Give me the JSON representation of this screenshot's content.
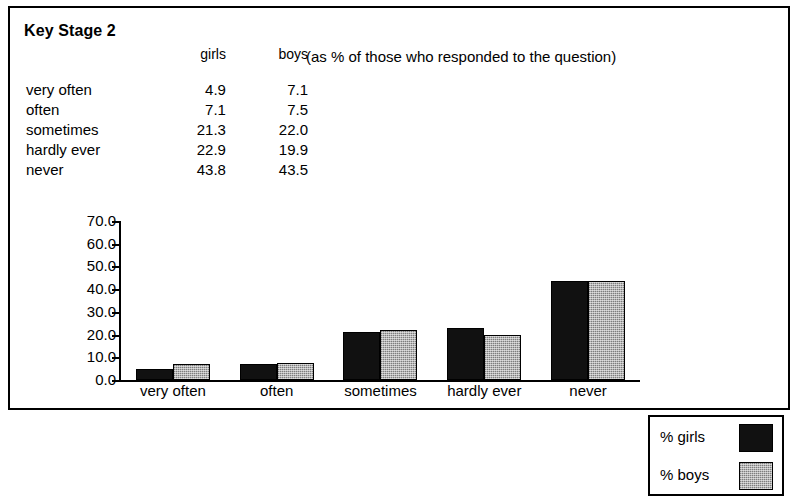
{
  "figure": {
    "title": "Key Stage 2",
    "note": "(as % of those who responded to the question)"
  },
  "table": {
    "columns": [
      "",
      "girls",
      "boys"
    ],
    "rows": [
      {
        "label": "very often",
        "girls": "4.9",
        "boys": "7.1"
      },
      {
        "label": "often",
        "girls": "7.1",
        "boys": "7.5"
      },
      {
        "label": "sometimes",
        "girls": "21.3",
        "boys": "22.0"
      },
      {
        "label": "hardly ever",
        "girls": "22.9",
        "boys": "19.9"
      },
      {
        "label": "never",
        "girls": "43.8",
        "boys": "43.5"
      }
    ]
  },
  "legend": {
    "items": [
      {
        "label": "% girls",
        "color": "#111111"
      },
      {
        "label": "% boys",
        "color": "#b4b4b4"
      }
    ]
  },
  "chart_data": {
    "type": "bar",
    "title": "Key Stage 2",
    "subtitle": "(as % of those who responded to the question)",
    "xlabel": "",
    "ylabel": "",
    "categories": [
      "very often",
      "often",
      "sometimes",
      "hardly ever",
      "never"
    ],
    "series": [
      {
        "name": "% girls",
        "color": "#111111",
        "values": [
          4.9,
          7.1,
          21.3,
          22.9,
          43.8
        ]
      },
      {
        "name": "% boys",
        "color": "#b4b4b4",
        "values": [
          7.1,
          7.5,
          22.0,
          19.9,
          43.5
        ]
      }
    ],
    "ylim": [
      0.0,
      70.0
    ],
    "ytick_step": 10.0,
    "yticks": [
      "0.0",
      "10.0",
      "20.0",
      "30.0",
      "40.0",
      "50.0",
      "60.0",
      "70.0"
    ],
    "grid": false,
    "legend_position": "right"
  }
}
